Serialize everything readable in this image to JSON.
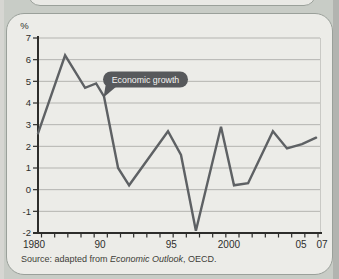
{
  "page": {
    "background": "#c8ccc6",
    "card_background": "#ecece8"
  },
  "chart_data": {
    "type": "line",
    "title": "",
    "ylabel": "%",
    "xlabel": "",
    "ylim": [
      -2,
      7
    ],
    "grid": "horizontal",
    "legend": "none",
    "y_ticks": [
      7,
      6,
      5,
      4,
      3,
      2,
      1,
      0,
      -1,
      -2
    ],
    "x_axis_labels": [
      {
        "label": "1980",
        "frac": -0.014
      },
      {
        "label": "90",
        "frac": 0.22
      },
      {
        "label": "95",
        "frac": 0.473
      },
      {
        "label": "2000",
        "frac": 0.677
      },
      {
        "label": "05",
        "frac": 0.933
      },
      {
        "label": "07",
        "frac": 1.007
      }
    ],
    "x_minor_tick_count": 22,
    "series_name": "Economic growth",
    "points": [
      {
        "year": 1980,
        "value": 2.6,
        "x_frac": 0.0
      },
      {
        "year": 1988,
        "value": 6.2,
        "x_frac": 0.096
      },
      {
        "year": 1989,
        "value": 4.7,
        "x_frac": 0.167
      },
      {
        "year": 1990,
        "value": 4.9,
        "x_frac": 0.206
      },
      {
        "year": 1991,
        "value": 4.3,
        "x_frac": 0.234
      },
      {
        "year": 1992,
        "value": 1.0,
        "x_frac": 0.284
      },
      {
        "year": 1993,
        "value": 0.2,
        "x_frac": 0.323
      },
      {
        "year": 1996,
        "value": 2.7,
        "x_frac": 0.461
      },
      {
        "year": 1997,
        "value": 1.6,
        "x_frac": 0.507
      },
      {
        "year": 1998,
        "value": -1.9,
        "x_frac": 0.56
      },
      {
        "year": 2000,
        "value": 2.9,
        "x_frac": 0.649
      },
      {
        "year": 2001,
        "value": 0.2,
        "x_frac": 0.695
      },
      {
        "year": 2002,
        "value": 0.3,
        "x_frac": 0.745
      },
      {
        "year": 2004,
        "value": 2.7,
        "x_frac": 0.833
      },
      {
        "year": 2005,
        "value": 1.9,
        "x_frac": 0.883
      },
      {
        "year": 2006,
        "value": 2.1,
        "x_frac": 0.936
      },
      {
        "year": 2007,
        "value": 2.4,
        "x_frac": 0.986
      }
    ],
    "annotation": {
      "label": "Economic growth"
    },
    "line_color": "#5e6164",
    "annotation_bg": "#57595c",
    "axis_color": "#2d2d2b",
    "grid_color": "#b4b4b0"
  },
  "source": {
    "prefix": "Source: adapted from ",
    "italic": "Economic Outlook",
    "suffix": ", OECD.",
    "full": "Source: adapted from Economic Outlook, OECD."
  }
}
